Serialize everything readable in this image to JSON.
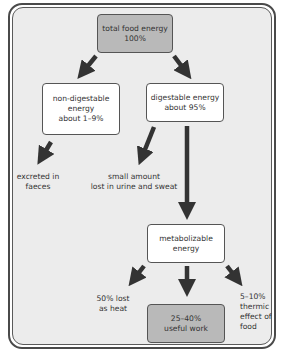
{
  "diagram": {
    "title_box": {
      "line1": "total food energy",
      "line2": "100%"
    },
    "non_digestable": {
      "line1": "non-digestable",
      "line2": "energy",
      "line3": "about 1–9%"
    },
    "digestable": {
      "line1": "digestable energy",
      "line2": "about 95%"
    },
    "excreted": {
      "line1": "excreted in",
      "line2": "faeces"
    },
    "urine_sweat": {
      "line1": "small amount",
      "line2": "lost in urine and sweat"
    },
    "metabolizable": {
      "line1": "metabolizable",
      "line2": "energy"
    },
    "heat": {
      "line1": "50% lost",
      "line2": "as heat"
    },
    "useful_work": {
      "line1": "25–40%",
      "line2": "useful work"
    },
    "thermic": {
      "line1": "5–10%",
      "line2": "thermic",
      "line3": "effect of",
      "line4": "food"
    }
  },
  "colors": {
    "panel_background": "#ececec",
    "highlight_box": "#b9b9b9",
    "plain_box": "#ffffff",
    "arrow": "#333333",
    "border": "#555555"
  },
  "icons": {
    "arrow": "down-pointing-arrow"
  }
}
